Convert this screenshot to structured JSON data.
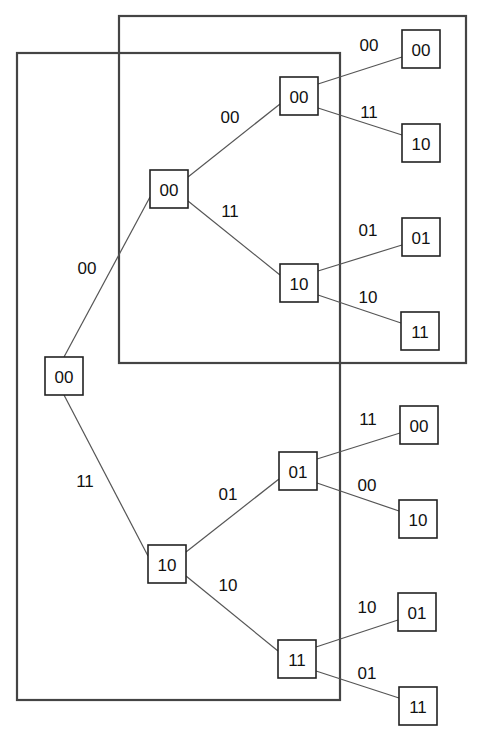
{
  "diagram": {
    "type": "tree",
    "frames": [
      {
        "id": "frame-left",
        "x": 17,
        "y": 53,
        "w": 323,
        "h": 647
      },
      {
        "id": "frame-top-right",
        "x": 119,
        "y": 16,
        "w": 347,
        "h": 347
      }
    ],
    "nodes": [
      {
        "id": "n0",
        "label": "00",
        "cx": 64,
        "cy": 376
      },
      {
        "id": "n1",
        "label": "00",
        "cx": 169,
        "cy": 189
      },
      {
        "id": "n2",
        "label": "10",
        "cx": 167,
        "cy": 564
      },
      {
        "id": "n3",
        "label": "00",
        "cx": 299,
        "cy": 96
      },
      {
        "id": "n4",
        "label": "10",
        "cx": 299,
        "cy": 283
      },
      {
        "id": "n5",
        "label": "01",
        "cx": 298,
        "cy": 471
      },
      {
        "id": "n6",
        "label": "11",
        "cx": 297,
        "cy": 659
      },
      {
        "id": "n7",
        "label": "00",
        "cx": 421,
        "cy": 49
      },
      {
        "id": "n8",
        "label": "10",
        "cx": 421,
        "cy": 143
      },
      {
        "id": "n9",
        "label": "01",
        "cx": 421,
        "cy": 237
      },
      {
        "id": "n10",
        "label": "11",
        "cx": 420,
        "cy": 331
      },
      {
        "id": "n11",
        "label": "00",
        "cx": 419,
        "cy": 425
      },
      {
        "id": "n12",
        "label": "10",
        "cx": 418,
        "cy": 519
      },
      {
        "id": "n13",
        "label": "01",
        "cx": 417,
        "cy": 612
      },
      {
        "id": "n14",
        "label": "11",
        "cx": 418,
        "cy": 706
      }
    ],
    "edges": [
      {
        "from": "n0",
        "to": "n1",
        "label": "00",
        "lx": 87,
        "ly": 268
      },
      {
        "from": "n0",
        "to": "n2",
        "label": "11",
        "lx": 85,
        "ly": 481
      },
      {
        "from": "n1",
        "to": "n3",
        "label": "00",
        "lx": 230,
        "ly": 117
      },
      {
        "from": "n1",
        "to": "n4",
        "label": "11",
        "lx": 230,
        "ly": 211
      },
      {
        "from": "n2",
        "to": "n5",
        "label": "01",
        "lx": 228,
        "ly": 494
      },
      {
        "from": "n2",
        "to": "n6",
        "label": "10",
        "lx": 228,
        "ly": 585
      },
      {
        "from": "n3",
        "to": "n7",
        "label": "00",
        "lx": 369,
        "ly": 45
      },
      {
        "from": "n3",
        "to": "n8",
        "label": "11",
        "lx": 369,
        "ly": 112
      },
      {
        "from": "n4",
        "to": "n9",
        "label": "01",
        "lx": 368,
        "ly": 230
      },
      {
        "from": "n4",
        "to": "n10",
        "label": "10",
        "lx": 368,
        "ly": 297
      },
      {
        "from": "n5",
        "to": "n11",
        "label": "11",
        "lx": 368,
        "ly": 419
      },
      {
        "from": "n5",
        "to": "n12",
        "label": "00",
        "lx": 367,
        "ly": 485
      },
      {
        "from": "n6",
        "to": "n13",
        "label": "10",
        "lx": 367,
        "ly": 607
      },
      {
        "from": "n6",
        "to": "n14",
        "label": "01",
        "lx": 367,
        "ly": 673
      }
    ]
  }
}
